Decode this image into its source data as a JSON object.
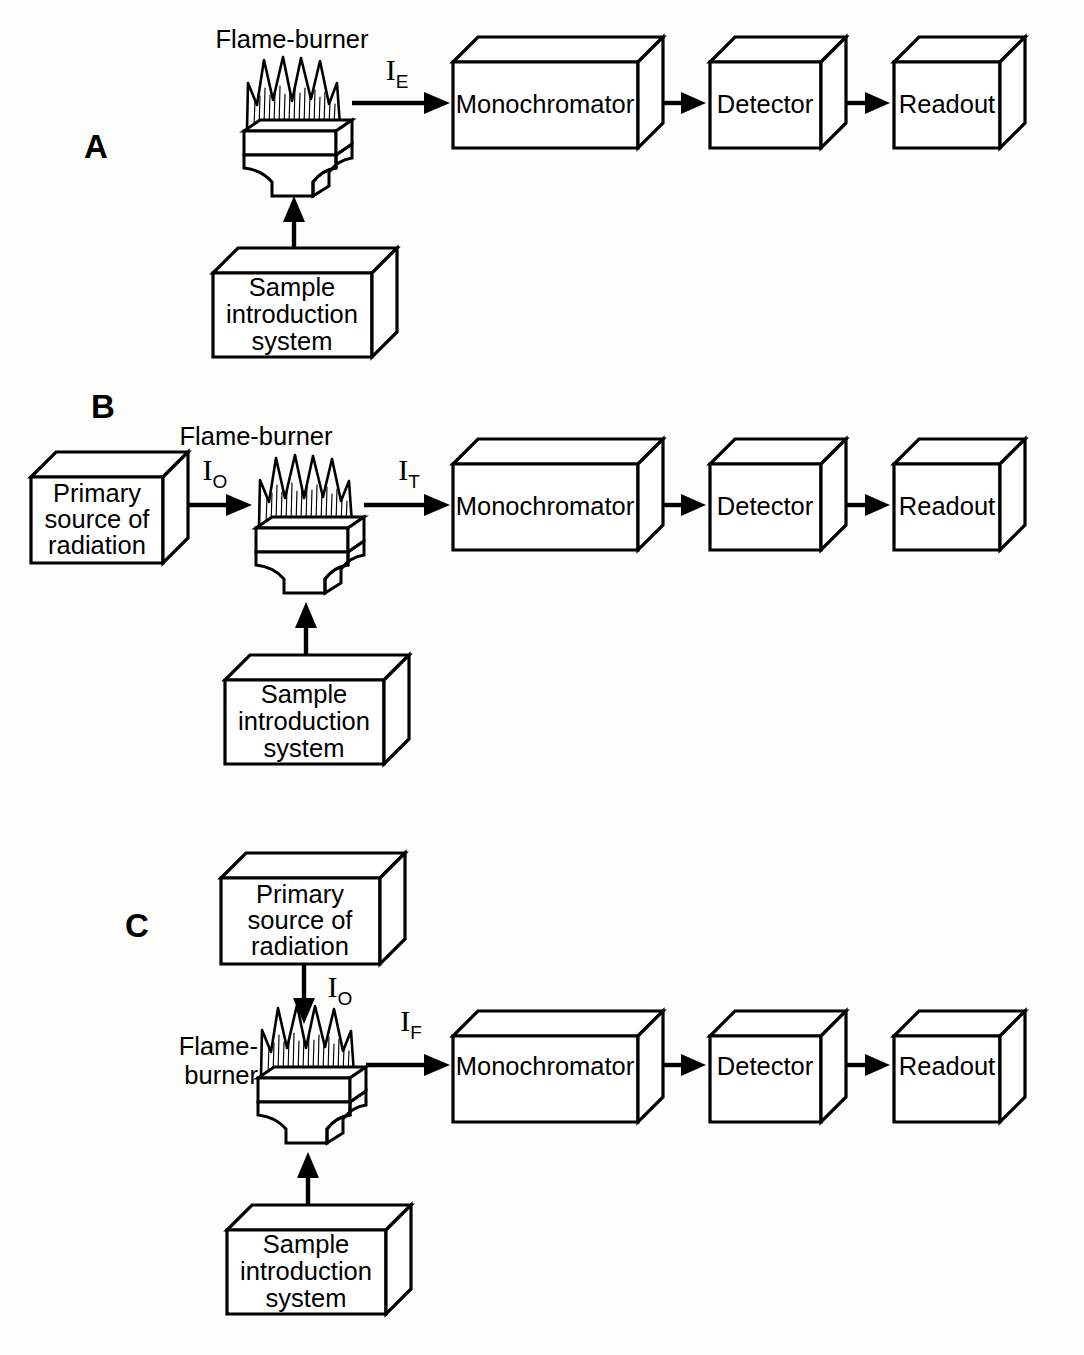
{
  "figure": {
    "background_color": "#fdfdfc",
    "line_color": "#000000",
    "panels": [
      {
        "letter": "A",
        "technique": "flame emission",
        "flame_caption": "Flame-burner",
        "flame_caption_line2": "",
        "signal_labels": [
          {
            "symbol": "I",
            "subscript": "E",
            "direction": "right"
          }
        ],
        "boxes": [
          {
            "id": "sample-introduction",
            "lines": [
              "Sample",
              "introduction",
              "system"
            ]
          },
          {
            "id": "monochromator",
            "lines": [
              "Monochromator"
            ]
          },
          {
            "id": "detector",
            "lines": [
              "Detector"
            ]
          },
          {
            "id": "readout",
            "lines": [
              "Readout"
            ]
          }
        ]
      },
      {
        "letter": "B",
        "technique": "flame absorption",
        "flame_caption": "Flame-burner",
        "flame_caption_line2": "",
        "signal_labels": [
          {
            "symbol": "I",
            "subscript": "O",
            "direction": "right"
          },
          {
            "symbol": "I",
            "subscript": "T",
            "direction": "right"
          }
        ],
        "boxes": [
          {
            "id": "primary-source",
            "lines": [
              "Primary",
              "source of",
              "radiation"
            ]
          },
          {
            "id": "sample-introduction",
            "lines": [
              "Sample",
              "introduction",
              "system"
            ]
          },
          {
            "id": "monochromator",
            "lines": [
              "Monochromator"
            ]
          },
          {
            "id": "detector",
            "lines": [
              "Detector"
            ]
          },
          {
            "id": "readout",
            "lines": [
              "Readout"
            ]
          }
        ]
      },
      {
        "letter": "C",
        "technique": "flame fluorescence",
        "flame_caption": "Flame-",
        "flame_caption_line2": "burner",
        "signal_labels": [
          {
            "symbol": "I",
            "subscript": "O",
            "direction": "down"
          },
          {
            "symbol": "I",
            "subscript": "F",
            "direction": "right"
          }
        ],
        "boxes": [
          {
            "id": "primary-source",
            "lines": [
              "Primary",
              "source of",
              "radiation"
            ]
          },
          {
            "id": "sample-introduction",
            "lines": [
              "Sample",
              "introduction",
              "system"
            ]
          },
          {
            "id": "monochromator",
            "lines": [
              "Monochromator"
            ]
          },
          {
            "id": "detector",
            "lines": [
              "Detector"
            ]
          },
          {
            "id": "readout",
            "lines": [
              "Readout"
            ]
          }
        ]
      }
    ],
    "text": {
      "panel_a_letter": "A",
      "panel_b_letter": "B",
      "panel_c_letter": "C",
      "flame_burner": "Flame-burner",
      "flame_dash": "Flame-",
      "burner": "burner",
      "sample_l1": "Sample",
      "sample_l2": "introduction",
      "sample_l3": "system",
      "primary_l1": "Primary",
      "primary_l2": "source of",
      "primary_l3": "radiation",
      "monochromator": "Monochromator",
      "detector": "Detector",
      "readout": "Readout",
      "i_symbol": "I",
      "sub_e": "E",
      "sub_o": "O",
      "sub_t": "T",
      "sub_f": "F"
    }
  }
}
